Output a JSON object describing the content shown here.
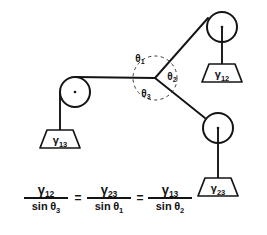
{
  "figure": {
    "ink_color": "#141414",
    "background_color": "#ffffff"
  },
  "junction": {
    "label": "junction-node",
    "x": 155,
    "y": 78
  },
  "angles": [
    {
      "id": "theta1",
      "symbol": "θ",
      "subscript": "1",
      "x": 140,
      "y": 62
    },
    {
      "id": "theta2",
      "symbol": "θ",
      "subscript": "2",
      "x": 172,
      "y": 80
    },
    {
      "id": "theta3",
      "symbol": "θ",
      "subscript": "3",
      "x": 146,
      "y": 97
    }
  ],
  "pulleys": [
    {
      "id": "pulley-left",
      "cx": 75,
      "cy": 92,
      "r": 15
    },
    {
      "id": "pulley-top-right",
      "cx": 222,
      "cy": 27,
      "r": 15
    },
    {
      "id": "pulley-bottom-right",
      "cx": 218,
      "cy": 128,
      "r": 15
    }
  ],
  "weights": [
    {
      "id": "weight-gamma-13",
      "symbol": "γ",
      "subscript": "13",
      "top_width": 26,
      "bottom_width": 40,
      "height": 18,
      "cx": 60,
      "top_y": 130,
      "rope_from_y": 92,
      "rope_x": 60
    },
    {
      "id": "weight-gamma-12",
      "symbol": "γ",
      "subscript": "12",
      "top_width": 26,
      "bottom_width": 40,
      "height": 18,
      "cx": 222,
      "top_y": 64,
      "rope_from_y": 27,
      "rope_x": 222
    },
    {
      "id": "weight-gamma-23",
      "symbol": "γ",
      "subscript": "23",
      "top_width": 26,
      "bottom_width": 40,
      "height": 18,
      "cx": 218,
      "top_y": 178,
      "rope_from_y": 128,
      "rope_x": 218
    }
  ],
  "ropes": [
    {
      "id": "rope-junction-to-left-pulley",
      "x1": 155,
      "y1": 78,
      "x2": 75,
      "y2": 77
    },
    {
      "id": "rope-junction-to-top-pulley",
      "x1": 155,
      "y1": 78,
      "x2": 208,
      "y2": 18
    },
    {
      "id": "rope-junction-to-bottom-pulley",
      "x1": 155,
      "y1": 78,
      "x2": 205,
      "y2": 118
    }
  ],
  "equation": {
    "id": "lami-equation",
    "terms": [
      {
        "numerator_symbol": "γ",
        "numerator_sub": "12",
        "denominator_text": "sin",
        "denominator_symbol": "θ",
        "denominator_sub": "3"
      },
      {
        "numerator_symbol": "γ",
        "numerator_sub": "23",
        "denominator_text": "sin",
        "denominator_symbol": "θ",
        "denominator_sub": "1"
      },
      {
        "numerator_symbol": "γ",
        "numerator_sub": "13",
        "denominator_text": "sin",
        "denominator_symbol": "θ",
        "denominator_sub": "2"
      }
    ],
    "operators": [
      "=",
      "="
    ],
    "plain_text": "γ₁₂ / sin θ₃ = γ₂₃ / sin θ₁ = γ₁₃ / sin θ₂"
  }
}
